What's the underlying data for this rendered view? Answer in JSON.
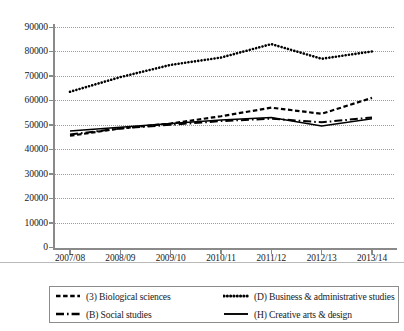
{
  "chart_data": {
    "type": "line",
    "title": "",
    "subtitle": "",
    "xlabel": "",
    "ylabel": "",
    "categories": [
      "2007/08",
      "2008/09",
      "2009/10",
      "2010/11",
      "2011/12",
      "2012/13",
      "2013/14"
    ],
    "ylim": [
      0,
      90000
    ],
    "ytick_values": [
      0,
      10000,
      20000,
      30000,
      40000,
      50000,
      60000,
      70000,
      80000,
      90000
    ],
    "ytick_labels": [
      "0",
      "10000",
      "20000",
      "30000",
      "40000",
      "50000",
      "60000",
      "70000",
      "80000",
      "90000"
    ],
    "grid": "horizontal-dotted",
    "legend_position": "bottom",
    "series": [
      {
        "name": "(3) Biological sciences",
        "style": "dashed",
        "color": "#000000",
        "values": [
          45500,
          48500,
          50500,
          53500,
          57000,
          54500,
          61000
        ]
      },
      {
        "name": "(D) Business & administrative studies",
        "style": "dotted",
        "color": "#000000",
        "values": [
          63500,
          69500,
          74500,
          77500,
          83000,
          77000,
          80000
        ]
      },
      {
        "name": "(B) Social studies",
        "style": "dash-dot",
        "color": "#000000",
        "values": [
          46000,
          48500,
          50000,
          51500,
          52500,
          51000,
          53000
        ]
      },
      {
        "name": "(H) Creative arts & design",
        "style": "solid",
        "color": "#000000",
        "values": [
          47500,
          49000,
          50500,
          52000,
          53000,
          49500,
          52500
        ]
      }
    ]
  },
  "legend": {
    "entries": [
      {
        "label": "(3) Biological sciences",
        "style": "dashed"
      },
      {
        "label": "(D) Business & administrative studies",
        "style": "dotted"
      },
      {
        "label": "(B) Social studies",
        "style": "dash-dot"
      },
      {
        "label": "(H) Creative arts & design",
        "style": "solid"
      }
    ]
  }
}
